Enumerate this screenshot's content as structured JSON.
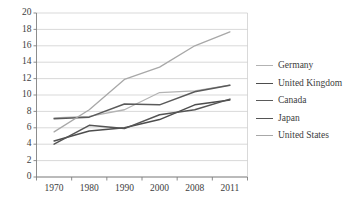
{
  "chart_data": {
    "type": "line",
    "title": "",
    "subtitle": "",
    "xlabel": "",
    "ylabel": "",
    "categories": [
      "1970",
      "1980",
      "1990",
      "2000",
      "2008",
      "2011"
    ],
    "ylim": [
      0,
      20
    ],
    "ytick_labels": [
      "0",
      "2",
      "4",
      "6",
      "8",
      "10",
      "12",
      "14",
      "16",
      "18",
      "20"
    ],
    "ytick_values": [
      0,
      2,
      4,
      6,
      8,
      10,
      12,
      14,
      16,
      18,
      20
    ],
    "grid": "horizontal",
    "legend_position": "right",
    "series": [
      {
        "name": "Germany",
        "color": "#b3b3b3",
        "width": 1.3,
        "values": [
          7.2,
          7.4,
          8.2,
          10.3,
          10.5,
          11.2
        ]
      },
      {
        "name": "United Kingdom",
        "color": "#4d4d4d",
        "width": 1.5,
        "values": [
          4.4,
          5.6,
          6.0,
          7.0,
          8.8,
          9.4
        ]
      },
      {
        "name": "Canada",
        "color": "#5a5a5a",
        "width": 1.5,
        "values": [
          7.1,
          7.3,
          8.9,
          8.8,
          10.4,
          11.2
        ]
      },
      {
        "name": "Japan",
        "color": "#555555",
        "width": 1.5,
        "values": [
          4.0,
          6.3,
          5.9,
          7.6,
          8.2,
          9.5
        ]
      },
      {
        "name": "United States",
        "color": "#a8a8a8",
        "width": 1.3,
        "values": [
          5.5,
          8.2,
          11.9,
          13.4,
          16.0,
          17.7
        ]
      }
    ],
    "axis_color": "#808080",
    "grid_color": "#c8c8c8",
    "background": "#ffffff"
  },
  "legend": {
    "items": [
      {
        "label": "Germany"
      },
      {
        "label": "United Kingdom"
      },
      {
        "label": "Canada"
      },
      {
        "label": "Japan"
      },
      {
        "label": "United States"
      }
    ]
  }
}
